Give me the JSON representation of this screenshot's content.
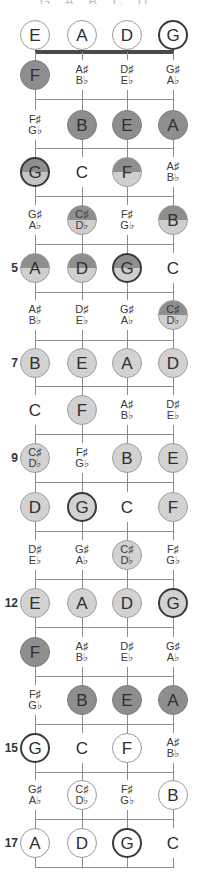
{
  "title_cut": "G A B C D E F",
  "strings": [
    "E",
    "A",
    "D",
    "G"
  ],
  "string_x": [
    35,
    82,
    127,
    173
  ],
  "row_y": [
    35,
    75,
    125,
    172,
    220,
    268,
    315,
    363,
    410,
    458,
    507,
    555,
    603,
    652,
    700,
    748,
    795,
    843
  ],
  "fret_line_y": [
    99,
    148,
    196,
    244,
    292,
    340,
    386,
    434,
    482,
    531,
    579,
    627,
    676,
    724,
    772,
    819,
    867
  ],
  "fret_markers": [
    {
      "row": 5,
      "label": "5"
    },
    {
      "row": 7,
      "label": "7"
    },
    {
      "row": 9,
      "label": "9"
    },
    {
      "row": 12,
      "label": "12"
    },
    {
      "row": 15,
      "label": "15"
    },
    {
      "row": 17,
      "label": "17"
    }
  ],
  "rows": [
    [
      {
        "n": "E",
        "s": "c-open"
      },
      {
        "n": "A",
        "s": "c-open"
      },
      {
        "n": "D",
        "s": "c-open"
      },
      {
        "n": "G",
        "s": "c-open-bold"
      }
    ],
    [
      {
        "n": "F",
        "s": "c-dark"
      },
      {
        "n": "A♯|B♭",
        "s": "plain"
      },
      {
        "n": "D♯|E♭",
        "s": "plain"
      },
      {
        "n": "G♯|A♭",
        "s": "plain"
      }
    ],
    [
      {
        "n": "F♯|G♭",
        "s": "plain"
      },
      {
        "n": "B",
        "s": "c-dark"
      },
      {
        "n": "E",
        "s": "c-dark"
      },
      {
        "n": "A",
        "s": "c-dark"
      }
    ],
    [
      {
        "n": "G",
        "s": "c-dark-bold"
      },
      {
        "n": "C",
        "s": "plain"
      },
      {
        "n": "F",
        "s": "c-half"
      },
      {
        "n": "A♯|B♭",
        "s": "plain"
      }
    ],
    [
      {
        "n": "G♯|A♭",
        "s": "plain"
      },
      {
        "n": "C♯|D♭",
        "s": "c-half"
      },
      {
        "n": "F♯|G♭",
        "s": "plain"
      },
      {
        "n": "B",
        "s": "c-half"
      }
    ],
    [
      {
        "n": "A",
        "s": "c-half"
      },
      {
        "n": "D",
        "s": "c-half"
      },
      {
        "n": "G",
        "s": "c-half-bold"
      },
      {
        "n": "C",
        "s": "plain"
      }
    ],
    [
      {
        "n": "A♯|B♭",
        "s": "plain"
      },
      {
        "n": "D♯|E♭",
        "s": "plain"
      },
      {
        "n": "G♯|A♭",
        "s": "plain"
      },
      {
        "n": "C♯|D♭",
        "s": "c-half"
      }
    ],
    [
      {
        "n": "B",
        "s": "c-light"
      },
      {
        "n": "E",
        "s": "c-light"
      },
      {
        "n": "A",
        "s": "c-light"
      },
      {
        "n": "D",
        "s": "c-light"
      }
    ],
    [
      {
        "n": "C",
        "s": "plain"
      },
      {
        "n": "F",
        "s": "c-light"
      },
      {
        "n": "A♯|B♭",
        "s": "plain"
      },
      {
        "n": "D♯|E♭",
        "s": "plain"
      }
    ],
    [
      {
        "n": "C♯|D♭",
        "s": "c-light"
      },
      {
        "n": "F♯|G♭",
        "s": "plain"
      },
      {
        "n": "B",
        "s": "c-light"
      },
      {
        "n": "E",
        "s": "c-light"
      }
    ],
    [
      {
        "n": "D",
        "s": "c-light"
      },
      {
        "n": "G",
        "s": "c-light-bold"
      },
      {
        "n": "C",
        "s": "plain"
      },
      {
        "n": "F",
        "s": "c-light"
      }
    ],
    [
      {
        "n": "D♯|E♭",
        "s": "plain"
      },
      {
        "n": "G♯|A♭",
        "s": "plain"
      },
      {
        "n": "C♯|D♭",
        "s": "c-light"
      },
      {
        "n": "F♯|G♭",
        "s": "plain"
      }
    ],
    [
      {
        "n": "E",
        "s": "c-light"
      },
      {
        "n": "A",
        "s": "c-light"
      },
      {
        "n": "D",
        "s": "c-light"
      },
      {
        "n": "G",
        "s": "c-light-bold"
      }
    ],
    [
      {
        "n": "F",
        "s": "c-dark"
      },
      {
        "n": "A♯|B♭",
        "s": "plain"
      },
      {
        "n": "D♯|E♭",
        "s": "plain"
      },
      {
        "n": "G♯|A♭",
        "s": "plain"
      }
    ],
    [
      {
        "n": "F♯|G♭",
        "s": "plain"
      },
      {
        "n": "B",
        "s": "c-dark"
      },
      {
        "n": "E",
        "s": "c-dark"
      },
      {
        "n": "A",
        "s": "c-dark"
      }
    ],
    [
      {
        "n": "G",
        "s": "c-open-bold"
      },
      {
        "n": "C",
        "s": "plain"
      },
      {
        "n": "F",
        "s": "c-open"
      },
      {
        "n": "A♯|B♭",
        "s": "plain"
      }
    ],
    [
      {
        "n": "G♯|A♭",
        "s": "plain"
      },
      {
        "n": "C♯|D♭",
        "s": "c-open"
      },
      {
        "n": "F♯|G♭",
        "s": "plain"
      },
      {
        "n": "B",
        "s": "c-open"
      }
    ],
    [
      {
        "n": "A",
        "s": "c-open"
      },
      {
        "n": "D",
        "s": "c-open"
      },
      {
        "n": "G",
        "s": "c-open-bold"
      },
      {
        "n": "C",
        "s": "plain"
      }
    ]
  ]
}
